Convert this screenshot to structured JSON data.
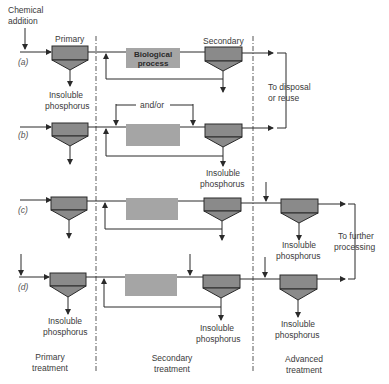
{
  "diagram": {
    "labels": {
      "chemical_addition_line1": "Chemical",
      "chemical_addition_line2": "addition",
      "primary": "Primary",
      "secondary": "Secondary",
      "biological_line1": "Biological",
      "biological_line2": "process",
      "insoluble": "Insoluble",
      "phosphorus": "phosphorus",
      "and_or": "and/or",
      "to_disposal_line1": "To disposal",
      "to_disposal_line2": "or reuse",
      "to_further_line1": "To further",
      "to_further_line2": "processing"
    },
    "rows": [
      {
        "id": "a",
        "label": "(a)"
      },
      {
        "id": "b",
        "label": "(b)"
      },
      {
        "id": "c",
        "label": "(c)"
      },
      {
        "id": "d",
        "label": "(d)"
      }
    ],
    "stages": [
      {
        "line1": "Primary",
        "line2": "treatment"
      },
      {
        "line1": "Secondary",
        "line2": "treatment"
      },
      {
        "line1": "Advanced",
        "line2": "treatment"
      }
    ],
    "colors": {
      "tank_fill": "#8a8a8a",
      "bio_fill": "#a5a5a5",
      "line": "#2a2a2a"
    }
  }
}
